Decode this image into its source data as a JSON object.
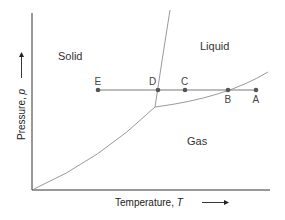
{
  "diagram": {
    "type": "phase-diagram",
    "axes": {
      "x_label": "Temperature, ",
      "x_symbol": "T",
      "y_label": "Pressure, ",
      "y_symbol": "p"
    },
    "regions": [
      {
        "name": "Solid",
        "x": 58,
        "y": 56
      },
      {
        "name": "Liquid",
        "x": 200,
        "y": 50
      },
      {
        "name": "Gas",
        "x": 187,
        "y": 145
      }
    ],
    "points": [
      {
        "label": "E",
        "x": 98,
        "y": 90,
        "label_pos": "above"
      },
      {
        "label": "D",
        "x": 158,
        "y": 90,
        "label_pos": "above"
      },
      {
        "label": "C",
        "x": 185,
        "y": 90,
        "label_pos": "above"
      },
      {
        "label": "B",
        "x": 228,
        "y": 90,
        "label_pos": "below"
      },
      {
        "label": "A",
        "x": 256,
        "y": 90,
        "label_pos": "below"
      }
    ],
    "colors": {
      "axis": "#333333",
      "curve": "#9a9a9a",
      "isobar": "#7a7a7a",
      "point": "#555555"
    }
  }
}
